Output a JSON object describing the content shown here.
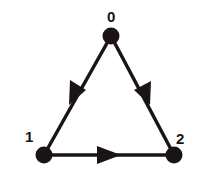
{
  "diagram": {
    "type": "directed-graph",
    "colors": {
      "ink": "#1a1414",
      "background": "#ffffff"
    },
    "nodes": [
      {
        "id": "0",
        "label": "0",
        "x": 111,
        "y": 36,
        "label_x": 112,
        "label_y": 20
      },
      {
        "id": "1",
        "label": "1",
        "x": 44,
        "y": 155,
        "label_x": 29,
        "label_y": 140
      },
      {
        "id": "2",
        "label": "2",
        "x": 174,
        "y": 155,
        "label_x": 181,
        "label_y": 142
      }
    ],
    "edges": [
      {
        "from": "0",
        "to": "1"
      },
      {
        "from": "0",
        "to": "2"
      },
      {
        "from": "1",
        "to": "2"
      }
    ]
  }
}
